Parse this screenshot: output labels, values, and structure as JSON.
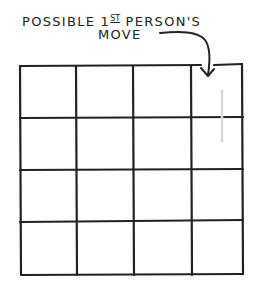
{
  "annotation": {
    "line1_prefix": "POSSIBLE 1",
    "line1_sup": "ST",
    "line1_suffix": " PERSON'S",
    "line2": "MOVE",
    "full_text": "POSSIBLE 1ST PERSON'S MOVE"
  },
  "grid": {
    "rows": 4,
    "cols": 4,
    "column_lines_x": [
      20,
      77,
      134,
      192,
      243
    ],
    "row_lines_y": [
      65,
      118,
      170,
      222,
      274
    ],
    "highlighted_cell": {
      "row": 0,
      "col": 3,
      "description": "target of arrow, possible first move"
    },
    "line_color": "#222222",
    "faint_mark_color": "#d8d8d8"
  },
  "arrow": {
    "from": "annotation",
    "to": "top-right cell"
  }
}
